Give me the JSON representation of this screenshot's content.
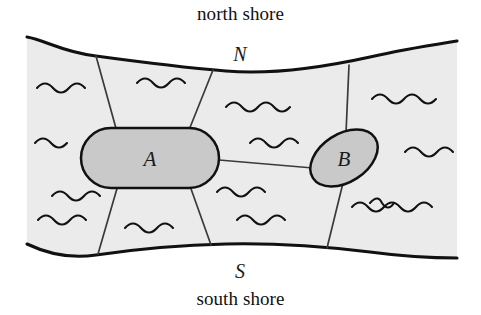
{
  "figure": {
    "north_shore_label": "north shore",
    "south_shore_label": "south shore",
    "nodes": [
      {
        "id": "N",
        "label": "N",
        "role": "north-bank-vertex",
        "x": 240,
        "y": 61
      },
      {
        "id": "S",
        "label": "S",
        "role": "south-bank-vertex",
        "x": 240,
        "y": 271
      },
      {
        "id": "A",
        "label": "A",
        "role": "island",
        "x": 150,
        "y": 157
      },
      {
        "id": "B",
        "label": "B",
        "role": "island",
        "x": 344,
        "y": 157
      }
    ],
    "colors": {
      "water_fill": "#ebebeb",
      "island_fill": "#c9c9c9",
      "outline": "#111111",
      "bridge": "#3a3a3a",
      "background": "#ffffff",
      "text": "#111111"
    },
    "counts": {
      "islands": 2,
      "shores": 2,
      "bridges": 7
    },
    "bridges": [
      {
        "from": "A",
        "to": "N",
        "name": "bridge-a-north-west"
      },
      {
        "from": "A",
        "to": "N",
        "name": "bridge-a-north-east"
      },
      {
        "from": "A",
        "to": "S",
        "name": "bridge-a-south-west"
      },
      {
        "from": "A",
        "to": "S",
        "name": "bridge-a-south-east"
      },
      {
        "from": "A",
        "to": "B",
        "name": "bridge-a-b"
      },
      {
        "from": "B",
        "to": "N",
        "name": "bridge-b-north"
      },
      {
        "from": "B",
        "to": "S",
        "name": "bridge-b-south"
      }
    ]
  }
}
